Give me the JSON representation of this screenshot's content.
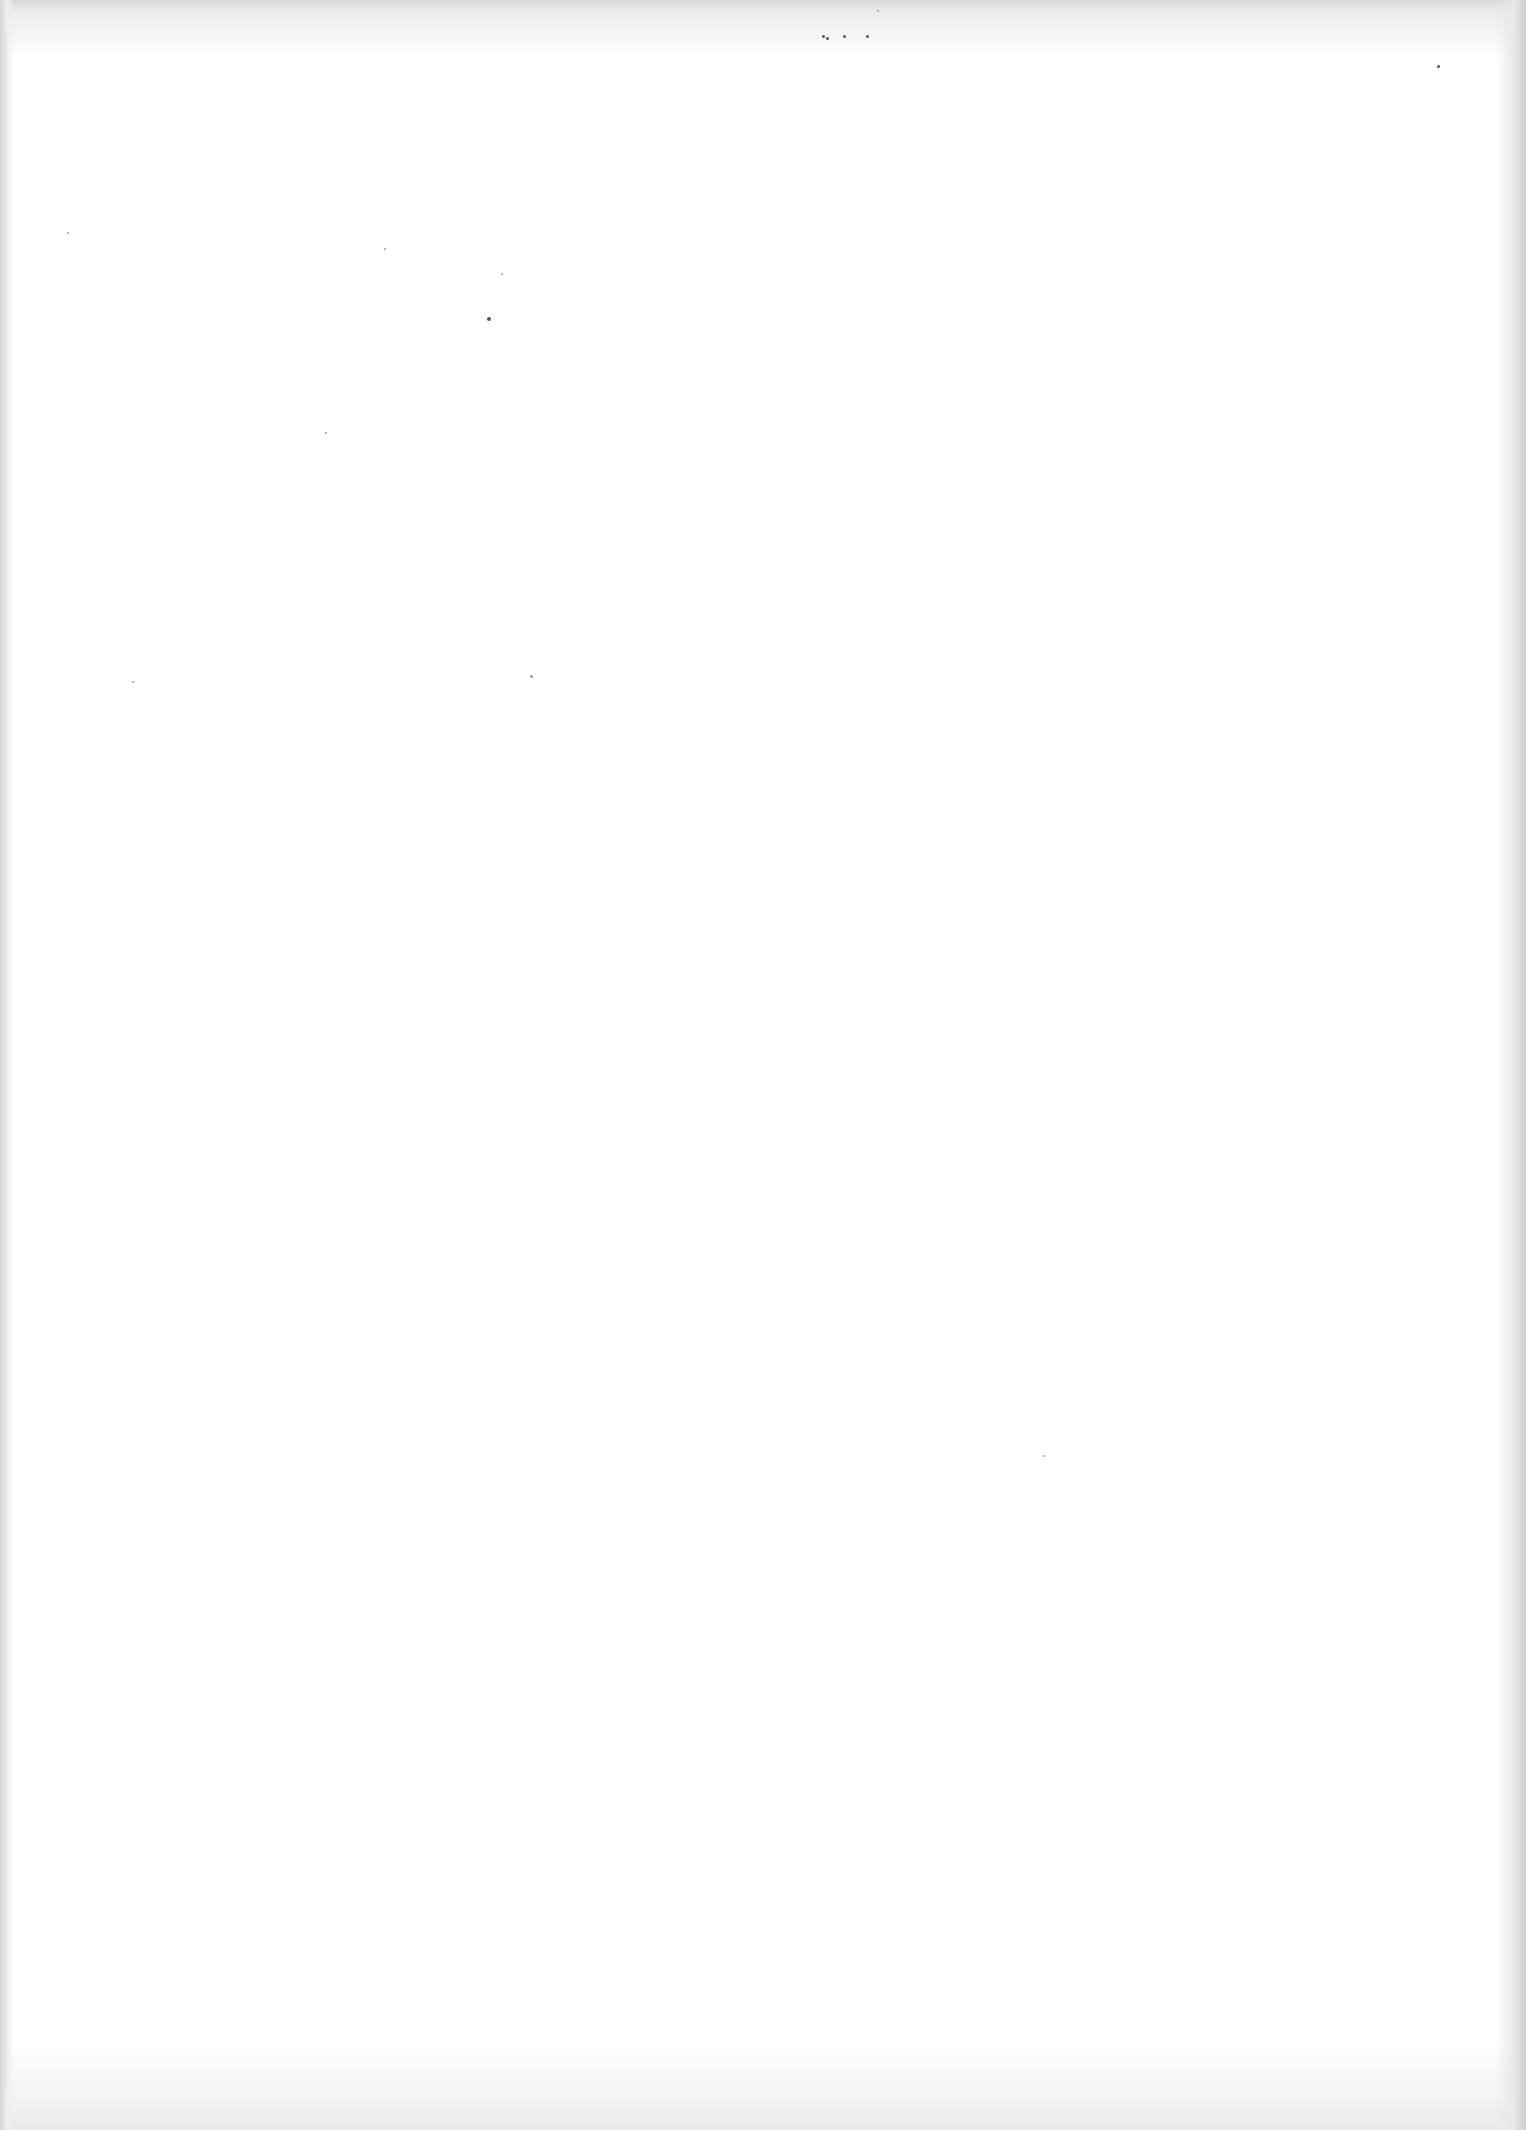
{
  "page": {
    "kind": "blank-scanned-page",
    "background_color": "#ffffff",
    "edge_shade_color": "#d6d6d6",
    "text_content": ""
  },
  "specks": [
    {
      "x": 822,
      "y": 35,
      "size": 3,
      "tone": "dark"
    },
    {
      "x": 826,
      "y": 37,
      "size": 3,
      "tone": "dark"
    },
    {
      "x": 843,
      "y": 35,
      "size": 3,
      "tone": "dark"
    },
    {
      "x": 866,
      "y": 35,
      "size": 3,
      "tone": "dark"
    },
    {
      "x": 877,
      "y": 10,
      "size": 2,
      "tone": "light"
    },
    {
      "x": 1437,
      "y": 65,
      "size": 3,
      "tone": "dark"
    },
    {
      "x": 67,
      "y": 232,
      "size": 2,
      "tone": "light"
    },
    {
      "x": 384,
      "y": 248,
      "size": 2,
      "tone": "light"
    },
    {
      "x": 501,
      "y": 273,
      "size": 2,
      "tone": "light"
    },
    {
      "x": 487,
      "y": 317,
      "size": 4,
      "tone": "dark"
    },
    {
      "x": 325,
      "y": 432,
      "size": 2,
      "tone": "light"
    },
    {
      "x": 530,
      "y": 675,
      "size": 3,
      "tone": "light"
    },
    {
      "x": 1043,
      "y": 1455,
      "size": 2,
      "tone": "light"
    },
    {
      "x": 132,
      "y": 681,
      "size": 2,
      "tone": "light"
    }
  ]
}
